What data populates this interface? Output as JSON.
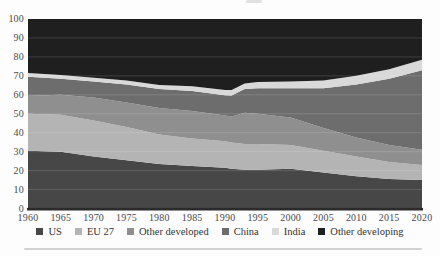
{
  "figure": {
    "background": "#fdfdfd",
    "axis_line_color": "#2b2b2b",
    "gridline_color": "rgba(255,255,255,0.16)",
    "y_ticks": [
      100,
      90,
      80,
      70,
      60,
      50,
      40,
      30,
      20,
      10,
      0
    ],
    "x_ticks": [
      1960,
      1965,
      1970,
      1975,
      1980,
      1985,
      1990,
      1995,
      2000,
      2005,
      2010,
      2015,
      2020
    ]
  },
  "chart_data": {
    "type": "area",
    "stacked": true,
    "title": "",
    "xlabel": "",
    "ylabel": "",
    "ylim": [
      0,
      100
    ],
    "xlim": [
      1960,
      2020
    ],
    "grid": "horizontal every 10, drawn faint over dark areas",
    "legend_position": "bottom",
    "x": [
      1960,
      1965,
      1970,
      1975,
      1980,
      1985,
      1990,
      1991,
      1993,
      1995,
      2000,
      2005,
      2010,
      2015,
      2020
    ],
    "series": [
      {
        "name": "US",
        "color": "#474747",
        "values": [
          30.5,
          30.0,
          27.5,
          25.5,
          23.5,
          22.5,
          21.5,
          21.0,
          20.5,
          20.5,
          21.0,
          19.0,
          17.0,
          15.5,
          15.0
        ]
      },
      {
        "name": "EU 27",
        "color": "#b4b4b4",
        "values": [
          19.5,
          19.5,
          19.0,
          17.5,
          15.5,
          14.5,
          14.0,
          13.8,
          13.5,
          13.5,
          12.5,
          11.5,
          10.5,
          9.0,
          8.0
        ]
      },
      {
        "name": "Other developed",
        "color": "#8f8f8f",
        "values": [
          9.5,
          10.5,
          12.0,
          13.0,
          14.0,
          14.5,
          13.5,
          13.7,
          16.5,
          16.0,
          14.5,
          12.0,
          10.0,
          9.0,
          8.0
        ]
      },
      {
        "name": "China",
        "color": "#6d6d6d",
        "values": [
          10.0,
          8.5,
          8.5,
          9.5,
          10.0,
          10.5,
          10.8,
          11.2,
          12.5,
          13.5,
          15.5,
          21.0,
          28.0,
          35.0,
          42.0
        ]
      },
      {
        "name": "India",
        "color": "#d9d9d9",
        "values": [
          2.0,
          2.0,
          2.0,
          2.0,
          2.2,
          2.5,
          2.7,
          2.8,
          3.0,
          3.2,
          3.5,
          4.0,
          4.5,
          5.0,
          5.5
        ]
      },
      {
        "name": "Other developing",
        "color": "#1f1f1f",
        "values": [
          28.5,
          29.5,
          31.0,
          32.5,
          34.8,
          35.5,
          37.5,
          37.5,
          34.0,
          33.3,
          33.0,
          32.5,
          30.0,
          26.5,
          21.5
        ]
      }
    ]
  },
  "legend": {
    "items": [
      {
        "label": "US",
        "color": "#474747"
      },
      {
        "label": "EU 27",
        "color": "#b4b4b4"
      },
      {
        "label": "Other developed",
        "color": "#8f8f8f"
      },
      {
        "label": "China",
        "color": "#6d6d6d"
      },
      {
        "label": "India",
        "color": "#d9d9d9"
      },
      {
        "label": "Other developing",
        "color": "#1f1f1f"
      }
    ]
  }
}
